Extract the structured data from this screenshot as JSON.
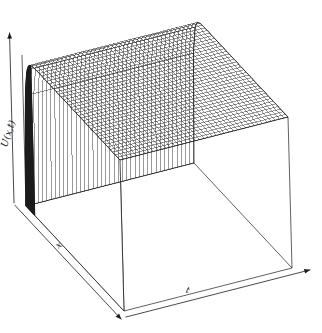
{
  "figure": {
    "kind": "3d-surface-mesh-plot",
    "background_color": "#ffffff",
    "line_color": "#1c1c1c",
    "surface_fill_color": "#ffffff",
    "shadow_color": "#8a8a8a"
  },
  "labels": {
    "vertical_axis": "U(x,t)",
    "depth_axis": "x",
    "horizontal_axis": "t"
  },
  "chart_data": {
    "type": "surface",
    "title": "",
    "xlabel": "t",
    "ylabel": "x",
    "zlabel": "U(x,t)",
    "grid": true,
    "legend": "none",
    "xlim": [
      0,
      1
    ],
    "ylim": [
      0,
      1
    ],
    "zlim": [
      0,
      1
    ],
    "x_tick_labels": [],
    "y_tick_labels": [],
    "z_tick_labels": [],
    "mesh": {
      "nx": 40,
      "nt": 40
    },
    "surface_model": {
      "form": "U(x,t) = 1 - exp(-k*x)",
      "k": 55,
      "plateau_value": 1.0,
      "boundary_value_at_x0": 0.0
    },
    "projection": {
      "type": "axonometric",
      "corner_pixels": {
        "surface_left": [
          22,
          55
        ],
        "surface_far": [
          190,
          12
        ],
        "surface_right": [
          315,
          105
        ],
        "surface_near": [
          120,
          160
        ],
        "base_near_bottom": [
          112,
          315
        ],
        "base_right_bottom": [
          283,
          248
        ],
        "base_left_bottom": [
          26,
          206
        ]
      }
    },
    "sampled_profile": {
      "x": [
        0.0,
        0.01,
        0.02,
        0.03,
        0.05,
        0.07,
        0.1,
        0.15,
        0.25,
        0.5,
        0.75,
        1.0
      ],
      "U": [
        0.0,
        0.42,
        0.67,
        0.81,
        0.94,
        0.98,
        0.996,
        1.0,
        1.0,
        1.0,
        1.0,
        1.0
      ]
    }
  }
}
